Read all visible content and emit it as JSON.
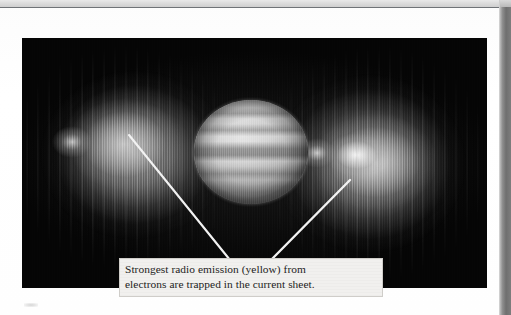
{
  "figure": {
    "kind": "radio-telescope-image",
    "photo": {
      "background_color": "#050505",
      "planet": {
        "name": "Jupiter",
        "appearance": "grayscale banded disk",
        "center_x": 229,
        "center_y": 114,
        "width": 114,
        "height": 104
      },
      "emission_lobes": [
        {
          "name": "left-radiation-belt-lobe",
          "side": "left",
          "brightness": "moderate-gray",
          "peak_color": "#cdcdcd"
        },
        {
          "name": "right-radiation-belt-lobe",
          "side": "right",
          "brightness": "bright-white-hotspot",
          "peak_color": "#fafafa"
        }
      ],
      "leader_lines": [
        {
          "name": "left-leader-line",
          "from_x": 107,
          "from_y": 97,
          "to_x": 208,
          "to_y": 222
        },
        {
          "name": "right-leader-line",
          "from_x": 328,
          "from_y": 142,
          "to_x": 250,
          "to_y": 221
        }
      ]
    },
    "caption": {
      "line1": "Strongest radio emission (yellow) from",
      "line2": "electrons are trapped in the current sheet.",
      "background_color": "#f1f0ee",
      "border_color": "#cfcdc9",
      "text_color": "#1d1d1d"
    },
    "page": {
      "paper_color": "#fdfdfd",
      "top_band_color": "#dcdcdc",
      "gutter_strip_color": "#6f6f6f",
      "rule_color": "#6f7377"
    }
  }
}
